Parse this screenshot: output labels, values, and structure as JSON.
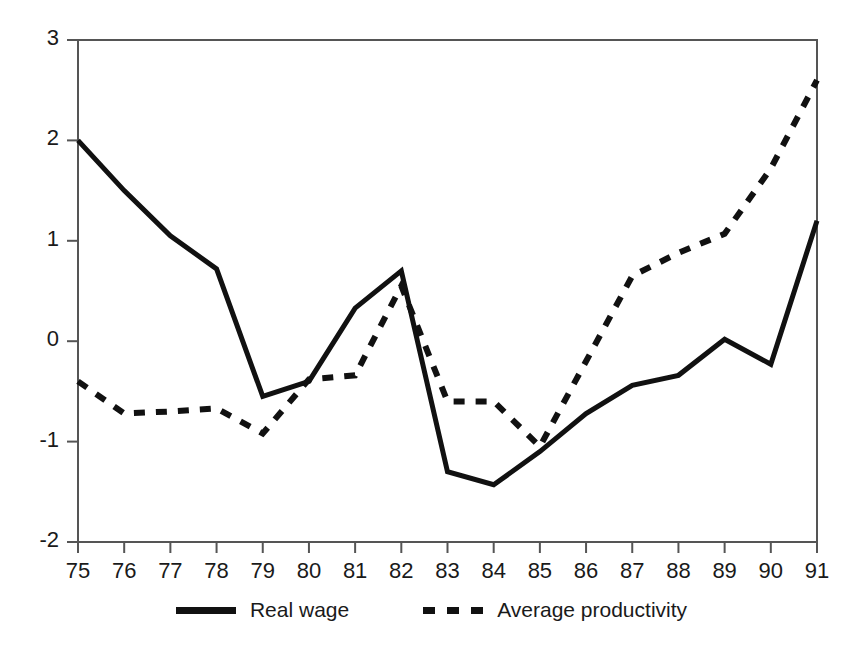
{
  "chart_data": {
    "type": "line",
    "title": "",
    "subtitle": "",
    "xlabel": "",
    "ylabel": "",
    "xlim": [
      75,
      91
    ],
    "ylim": [
      -2,
      3
    ],
    "grid": false,
    "legend_position": "bottom-center",
    "x": [
      75,
      76,
      77,
      78,
      79,
      80,
      81,
      82,
      83,
      84,
      85,
      86,
      87,
      88,
      89,
      90,
      91
    ],
    "categories": [
      "75",
      "76",
      "77",
      "78",
      "79",
      "80",
      "81",
      "82",
      "83",
      "84",
      "85",
      "86",
      "87",
      "88",
      "89",
      "90",
      "91"
    ],
    "xticks": [
      "75",
      "76",
      "77",
      "78",
      "79",
      "80",
      "81",
      "82",
      "83",
      "84",
      "85",
      "86",
      "87",
      "88",
      "89",
      "90",
      "91"
    ],
    "yticks": [
      "3",
      "2",
      "1",
      "0",
      "-1",
      "-2"
    ],
    "ytick_values": [
      3,
      2,
      1,
      0,
      -1,
      -2
    ],
    "series": [
      {
        "name": "Real wage",
        "style": "solid",
        "color": "#111111",
        "width": 5,
        "values": [
          2.0,
          1.5,
          1.05,
          0.72,
          -0.55,
          -0.4,
          0.33,
          0.7,
          -1.3,
          -1.43,
          -1.1,
          -0.72,
          -0.44,
          -0.34,
          0.02,
          -0.23,
          1.2
        ]
      },
      {
        "name": "Average productivity",
        "style": "dashed",
        "color": "#111111",
        "width": 6,
        "values": [
          -0.4,
          -0.72,
          -0.7,
          -0.67,
          -0.92,
          -0.38,
          -0.34,
          0.55,
          -0.6,
          -0.6,
          -1.05,
          -0.2,
          0.65,
          0.88,
          1.07,
          1.72,
          2.6
        ]
      }
    ]
  },
  "legend": {
    "items": [
      {
        "label": "Real wage",
        "style": "solid"
      },
      {
        "label": "Average productivity",
        "style": "dashed"
      }
    ]
  },
  "axes": {
    "frame_color": "#555555"
  }
}
